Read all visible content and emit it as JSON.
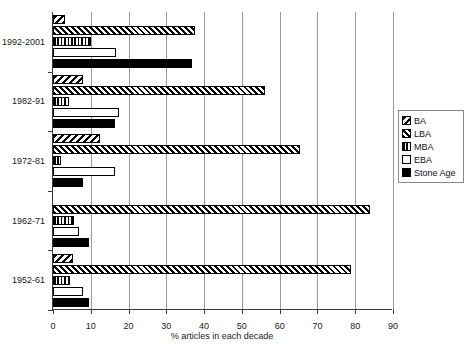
{
  "chart_data": {
    "type": "bar",
    "orientation": "horizontal",
    "title": "",
    "xlabel": "% articles in each decade",
    "ylabel": "",
    "xlim": [
      0,
      90
    ],
    "xticks": [
      0,
      10,
      20,
      30,
      40,
      50,
      60,
      70,
      80,
      90
    ],
    "grid": "vertical",
    "legend_position": "right",
    "categories": [
      "1952-61",
      "1962-71",
      "1972-81",
      "1982-91",
      "1992-2001"
    ],
    "series": [
      {
        "name": "BA",
        "pattern": "coarse-diagonal-hatch",
        "values": [
          5.3,
          0.0,
          12.5,
          8.0,
          3.2
        ]
      },
      {
        "name": "LBA",
        "pattern": "fine-diagonal-hatch",
        "values": [
          79.0,
          84.0,
          65.5,
          56.0,
          37.5
        ]
      },
      {
        "name": "MBA",
        "pattern": "vertical-lines",
        "values": [
          4.5,
          5.5,
          2.0,
          4.3,
          10.0
        ]
      },
      {
        "name": "EBA",
        "pattern": "white-fill",
        "values": [
          8.0,
          7.0,
          16.4,
          17.5,
          16.8
        ]
      },
      {
        "name": "Stone Age",
        "pattern": "solid-black",
        "values": [
          9.5,
          9.5,
          8.0,
          16.4,
          36.8
        ]
      }
    ]
  },
  "axis": {
    "x_title": "% articles in each decade",
    "tick_labels": [
      "0",
      "10",
      "20",
      "30",
      "40",
      "50",
      "60",
      "70",
      "80",
      "90"
    ],
    "category_labels": [
      "1952-61",
      "1962-71",
      "1972-81",
      "1982-91",
      "1992-2001"
    ]
  },
  "legend": {
    "entries": [
      {
        "label": "BA"
      },
      {
        "label": "LBA"
      },
      {
        "label": "MBA"
      },
      {
        "label": "EBA"
      },
      {
        "label": "Stone Age"
      }
    ]
  }
}
